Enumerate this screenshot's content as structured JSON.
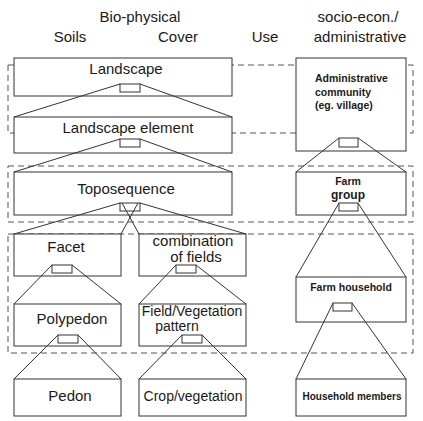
{
  "headers": {
    "biophysical": "Bio-physical",
    "soils": "Soils",
    "cover": "Cover",
    "use": "Use",
    "socio_line1": "socio-econ./",
    "socio_line2": "administrative"
  },
  "levels": {
    "landscape": "Landscape",
    "landscape_element": "Landscape element",
    "toposequence": "Toposequence",
    "facet": "Facet",
    "combination_line1": "combination",
    "combination_line2": "of fields",
    "polypedon": "Polypedon",
    "field_veg_line1": "Field/Vegetation",
    "field_veg_line2": "pattern",
    "pedon": "Pedon",
    "crop_vegetation": "Crop/vegetation"
  },
  "socio": {
    "admin_line1": "Administrative",
    "admin_line2": "community",
    "admin_line3": "(eg. village)",
    "farm_group_line1": "Farm",
    "farm_group_line2": "group",
    "farm_household": "Farm household",
    "household_members": "Household members"
  },
  "colors": {
    "stroke": "#333333",
    "dash": "#555555",
    "background": "#ffffff"
  }
}
